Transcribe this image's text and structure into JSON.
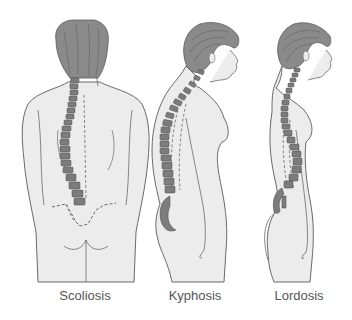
{
  "figure": {
    "colors": {
      "skin": "#ececec",
      "outline": "#6a6a6a",
      "hair": "#8a8a8a",
      "hair_line": "#5a5a5a",
      "vertebra": "#7c7c7c",
      "vertebra_edge": "#4a4a4a",
      "caption": "#555555"
    },
    "panels": [
      {
        "id": "scoliosis",
        "label": "Scoliosis",
        "view": "back"
      },
      {
        "id": "kyphosis",
        "label": "Kyphosis",
        "view": "side"
      },
      {
        "id": "lordosis",
        "label": "Lordosis",
        "view": "side"
      }
    ]
  }
}
